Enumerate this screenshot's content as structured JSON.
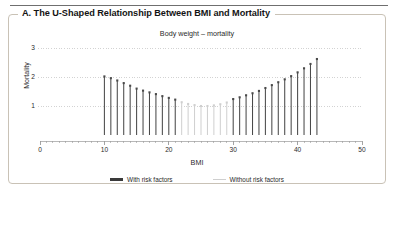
{
  "panel": {
    "title": "A. The U-Shaped Relationship Between BMI and Mortality"
  },
  "chart_data": {
    "type": "bar",
    "title": "Body weight – mortality",
    "xlabel": "BMI",
    "ylabel": "Mortality",
    "xlim": [
      0,
      50
    ],
    "ylim": [
      0,
      3.35
    ],
    "xticks": [
      0,
      10,
      20,
      30,
      40,
      50
    ],
    "xtick_labels": [
      "0",
      "10",
      "20",
      "30",
      "40",
      "50"
    ],
    "yticks": [
      1,
      2,
      3
    ],
    "ytick_labels": [
      "1",
      "2",
      "3"
    ],
    "minor_xtick_step": 1,
    "grid": "horizontal-dotted",
    "legend_position": "bottom-center",
    "colors": {
      "with_risk_factors": "#4a4a4a",
      "without_risk_factors": "#cfcfcf",
      "grid": "#c8c8c8",
      "axis": "#9a9a9a"
    },
    "legend": [
      {
        "name": "With risk factors",
        "color": "#4a4a4a"
      },
      {
        "name": "Without risk factors",
        "color": "#cfcfcf"
      }
    ],
    "series": [
      {
        "name": "With risk factors",
        "note": "dark stems — elevated mortality at low and high BMI",
        "x": [
          10,
          11,
          12,
          13,
          14,
          15,
          16,
          17,
          18,
          19,
          20,
          21,
          30,
          31,
          32,
          33,
          34,
          35,
          36,
          37,
          38,
          39,
          40,
          41,
          42,
          43
        ],
        "values": [
          2.02,
          1.96,
          1.88,
          1.79,
          1.7,
          1.6,
          1.53,
          1.47,
          1.41,
          1.34,
          1.28,
          1.22,
          1.24,
          1.3,
          1.37,
          1.44,
          1.52,
          1.62,
          1.72,
          1.82,
          1.92,
          2.03,
          2.16,
          2.3,
          2.45,
          2.62
        ]
      },
      {
        "name": "Without risk factors",
        "note": "light stems — near-baseline mortality across mid BMI range",
        "x": [
          22,
          23,
          24,
          25,
          26,
          27,
          28,
          29
        ],
        "values": [
          1.13,
          1.07,
          1.03,
          1.0,
          1.0,
          1.02,
          1.06,
          1.12
        ]
      }
    ]
  }
}
